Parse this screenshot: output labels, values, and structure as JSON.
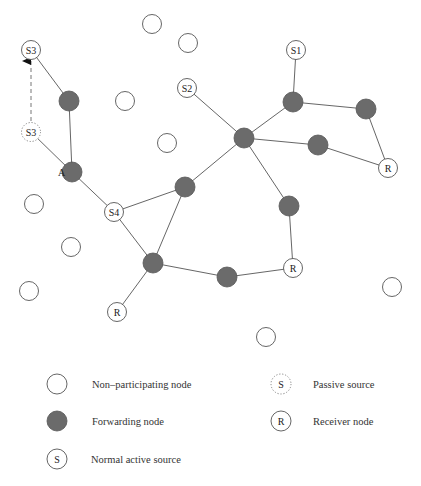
{
  "diagram": {
    "colors": {
      "forwarding_fill": "#6b6b6b",
      "node_stroke": "#555555",
      "empty_fill": "#ffffff",
      "edge": "#555555"
    },
    "nodes": [
      {
        "id": "np1",
        "type": "non-participating",
        "x": 152,
        "y": 24
      },
      {
        "id": "np2",
        "type": "non-participating",
        "x": 188,
        "y": 43
      },
      {
        "id": "np3",
        "type": "non-participating",
        "x": 125,
        "y": 101
      },
      {
        "id": "np4",
        "type": "non-participating",
        "x": 167,
        "y": 143
      },
      {
        "id": "np5",
        "type": "non-participating",
        "x": 34,
        "y": 204
      },
      {
        "id": "np6",
        "type": "non-participating",
        "x": 71,
        "y": 247
      },
      {
        "id": "np7",
        "type": "non-participating",
        "x": 29,
        "y": 291
      },
      {
        "id": "np8",
        "type": "non-participating",
        "x": 392,
        "y": 287
      },
      {
        "id": "np9",
        "type": "non-participating",
        "x": 266,
        "y": 337
      },
      {
        "id": "S3",
        "type": "active-source",
        "label": "S3",
        "x": 31,
        "y": 50
      },
      {
        "id": "S3p",
        "type": "passive-source",
        "label": "S3",
        "x": 31,
        "y": 132
      },
      {
        "id": "S2",
        "type": "active-source",
        "label": "S2",
        "x": 187,
        "y": 88
      },
      {
        "id": "S1",
        "type": "active-source",
        "label": "S1",
        "x": 296,
        "y": 50
      },
      {
        "id": "S4",
        "type": "active-source",
        "label": "S4",
        "x": 114,
        "y": 212
      },
      {
        "id": "f1",
        "type": "forwarding",
        "x": 69,
        "y": 101
      },
      {
        "id": "A",
        "type": "forwarding",
        "label": "A",
        "x": 72,
        "y": 172
      },
      {
        "id": "hub",
        "type": "forwarding",
        "x": 244,
        "y": 138
      },
      {
        "id": "f2",
        "type": "forwarding",
        "x": 293,
        "y": 102
      },
      {
        "id": "f3",
        "type": "forwarding",
        "x": 366,
        "y": 109
      },
      {
        "id": "f4",
        "type": "forwarding",
        "x": 318,
        "y": 145
      },
      {
        "id": "f5",
        "type": "forwarding",
        "x": 185,
        "y": 187
      },
      {
        "id": "f6",
        "type": "forwarding",
        "x": 289,
        "y": 206
      },
      {
        "id": "f7",
        "type": "forwarding",
        "x": 153,
        "y": 263
      },
      {
        "id": "f8",
        "type": "forwarding",
        "x": 227,
        "y": 277
      },
      {
        "id": "R1",
        "type": "receiver",
        "label": "R",
        "x": 388,
        "y": 168
      },
      {
        "id": "R2",
        "type": "receiver",
        "label": "R",
        "x": 293,
        "y": 268
      },
      {
        "id": "R3",
        "type": "receiver",
        "label": "R",
        "x": 117,
        "y": 312
      }
    ],
    "edges": [
      [
        "S3",
        "f1"
      ],
      [
        "f1",
        "A"
      ],
      [
        "S3p",
        "A"
      ],
      [
        "A",
        "S4"
      ],
      [
        "S2",
        "hub"
      ],
      [
        "S1",
        "f2"
      ],
      [
        "f2",
        "hub"
      ],
      [
        "f2",
        "f3"
      ],
      [
        "f3",
        "R1"
      ],
      [
        "hub",
        "f4"
      ],
      [
        "f4",
        "R1"
      ],
      [
        "hub",
        "f5"
      ],
      [
        "hub",
        "f6"
      ],
      [
        "f6",
        "R2"
      ],
      [
        "S4",
        "f5"
      ],
      [
        "S4",
        "f7"
      ],
      [
        "f5",
        "f7"
      ],
      [
        "f7",
        "f8"
      ],
      [
        "f8",
        "R2"
      ],
      [
        "f7",
        "R3"
      ]
    ],
    "move_arrow": {
      "from": "S3p",
      "to": "S3",
      "style": "dashed"
    },
    "side_label": {
      "text": "A",
      "x": 58,
      "y": 176
    }
  },
  "legend": {
    "items": [
      {
        "key": "non-participating",
        "symbol_label": "",
        "text": "Non–participating node",
        "x": 57,
        "y": 384,
        "text_x": 92
      },
      {
        "key": "forwarding",
        "symbol_label": "",
        "text": "Forwarding node",
        "x": 57,
        "y": 421,
        "text_x": 92
      },
      {
        "key": "active-source",
        "symbol_label": "S",
        "text": "Normal active source",
        "x": 57,
        "y": 459,
        "text_x": 91
      },
      {
        "key": "passive-source",
        "symbol_label": "S",
        "text": "Passive source",
        "x": 281,
        "y": 384,
        "text_x": 313
      },
      {
        "key": "receiver",
        "symbol_label": "R",
        "text": "Receiver node",
        "x": 281,
        "y": 421,
        "text_x": 313
      }
    ]
  }
}
